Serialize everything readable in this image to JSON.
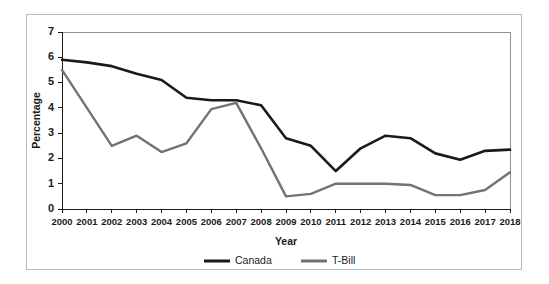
{
  "chart_data": {
    "type": "line",
    "title": "",
    "xlabel": "Year",
    "ylabel": "Percentage",
    "x": [
      2000,
      2001,
      2002,
      2003,
      2004,
      2005,
      2006,
      2007,
      2008,
      2009,
      2010,
      2011,
      2012,
      2013,
      2014,
      2015,
      2016,
      2017,
      2018
    ],
    "xtick_labels": [
      "2000",
      "2001",
      "2002",
      "2003",
      "2004",
      "2005",
      "2006",
      "2007",
      "2008",
      "2009",
      "2010",
      "2011",
      "2012",
      "2013",
      "2014",
      "2015",
      "2016",
      "2017",
      "2018"
    ],
    "ytick_labels": [
      "0",
      "1",
      "2",
      "3",
      "4",
      "5",
      "6",
      "7"
    ],
    "ylim": [
      0,
      7
    ],
    "xlim": [
      2000,
      2018
    ],
    "grid": false,
    "legend_position": "bottom-center",
    "series": [
      {
        "name": "Canada",
        "color": "#1a1a1a",
        "width": 2.6,
        "values": [
          5.9,
          5.8,
          5.65,
          5.35,
          5.1,
          4.4,
          4.3,
          4.3,
          4.1,
          2.8,
          2.5,
          1.5,
          2.4,
          2.9,
          2.8,
          2.2,
          1.95,
          2.3,
          2.35
        ]
      },
      {
        "name": "T-Bill",
        "color": "#737373",
        "width": 2.4,
        "values": [
          5.5,
          4.0,
          2.5,
          2.9,
          2.25,
          2.6,
          3.95,
          4.2,
          2.4,
          0.5,
          0.6,
          1.0,
          1.0,
          1.0,
          0.95,
          0.55,
          0.55,
          0.75,
          1.45
        ]
      }
    ]
  },
  "legend": {
    "entries": [
      {
        "label": "Canada",
        "color": "#1a1a1a"
      },
      {
        "label": "T-Bill",
        "color": "#737373"
      }
    ]
  },
  "axes": {
    "x_title": "Year",
    "y_title": "Percentage"
  },
  "colors": {
    "canada": "#1a1a1a",
    "tbill": "#737373",
    "axis": "#1a1a1a",
    "frame": "#b9b9b9",
    "background": "#ffffff"
  }
}
